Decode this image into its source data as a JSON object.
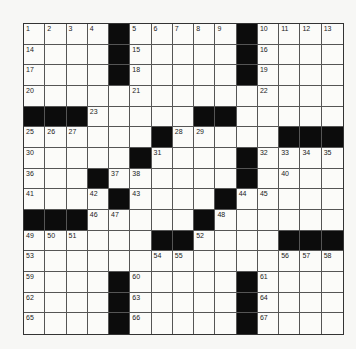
{
  "puzzle": {
    "rows": 15,
    "cols": 15,
    "colors": {
      "black": "#0c0c0c",
      "white": "#fbfbf9",
      "line": "#555555"
    },
    "layout": [
      "....#.....#....",
      "....#.....#....",
      "....#.....#....",
      "...............",
      "###.....##.....",
      "......#.....###",
      ".....#....#....",
      "...#......#....",
      "....#....#.....",
      "###.....#......",
      "......##....###",
      "...............",
      "....#.....#....",
      "....#.....#....",
      "....#.....#...."
    ],
    "numbers": [
      {
        "r": 0,
        "c": 0,
        "n": "1"
      },
      {
        "r": 0,
        "c": 1,
        "n": "2"
      },
      {
        "r": 0,
        "c": 2,
        "n": "3"
      },
      {
        "r": 0,
        "c": 3,
        "n": "4"
      },
      {
        "r": 0,
        "c": 5,
        "n": "5"
      },
      {
        "r": 0,
        "c": 6,
        "n": "6"
      },
      {
        "r": 0,
        "c": 7,
        "n": "7"
      },
      {
        "r": 0,
        "c": 8,
        "n": "8"
      },
      {
        "r": 0,
        "c": 9,
        "n": "9"
      },
      {
        "r": 0,
        "c": 11,
        "n": "10"
      },
      {
        "r": 0,
        "c": 12,
        "n": "11"
      },
      {
        "r": 0,
        "c": 13,
        "n": "12"
      },
      {
        "r": 0,
        "c": 14,
        "n": "13"
      },
      {
        "r": 1,
        "c": 0,
        "n": "14"
      },
      {
        "r": 1,
        "c": 5,
        "n": "15"
      },
      {
        "r": 1,
        "c": 11,
        "n": "16"
      },
      {
        "r": 2,
        "c": 0,
        "n": "17"
      },
      {
        "r": 2,
        "c": 5,
        "n": "18"
      },
      {
        "r": 2,
        "c": 11,
        "n": "19"
      },
      {
        "r": 3,
        "c": 0,
        "n": "20"
      },
      {
        "r": 3,
        "c": 5,
        "n": "21"
      },
      {
        "r": 3,
        "c": 11,
        "n": "22"
      },
      {
        "r": 4,
        "c": 3,
        "n": "23"
      },
      {
        "r": 4,
        "c": 9,
        "n": "24"
      },
      {
        "r": 5,
        "c": 0,
        "n": "25"
      },
      {
        "r": 5,
        "c": 1,
        "n": "26"
      },
      {
        "r": 5,
        "c": 2,
        "n": "27"
      },
      {
        "r": 5,
        "c": 7,
        "n": "28"
      },
      {
        "r": 5,
        "c": 8,
        "n": "29"
      },
      {
        "r": 6,
        "c": 0,
        "n": "30"
      },
      {
        "r": 6,
        "c": 6,
        "n": "31"
      },
      {
        "r": 6,
        "c": 11,
        "n": "32"
      },
      {
        "r": 6,
        "c": 12,
        "n": "33"
      },
      {
        "r": 6,
        "c": 13,
        "n": "34"
      },
      {
        "r": 6,
        "c": 14,
        "n": "35"
      },
      {
        "r": 7,
        "c": 0,
        "n": "36"
      },
      {
        "r": 7,
        "c": 4,
        "n": "37"
      },
      {
        "r": 7,
        "c": 5,
        "n": "38"
      },
      {
        "r": 7,
        "c": 10,
        "n": "39"
      },
      {
        "r": 7,
        "c": 12,
        "n": "40"
      },
      {
        "r": 8,
        "c": 0,
        "n": "41"
      },
      {
        "r": 8,
        "c": 3,
        "n": "42"
      },
      {
        "r": 8,
        "c": 5,
        "n": "43"
      },
      {
        "r": 8,
        "c": 10,
        "n": "44"
      },
      {
        "r": 8,
        "c": 11,
        "n": "45"
      },
      {
        "r": 9,
        "c": 3,
        "n": "46"
      },
      {
        "r": 9,
        "c": 4,
        "n": "47"
      },
      {
        "r": 9,
        "c": 9,
        "n": "48"
      },
      {
        "r": 10,
        "c": 0,
        "n": "49"
      },
      {
        "r": 10,
        "c": 1,
        "n": "50"
      },
      {
        "r": 10,
        "c": 2,
        "n": "51"
      },
      {
        "r": 10,
        "c": 8,
        "n": "52"
      },
      {
        "r": 11,
        "c": 0,
        "n": "53"
      },
      {
        "r": 11,
        "c": 6,
        "n": "54"
      },
      {
        "r": 11,
        "c": 7,
        "n": "55"
      },
      {
        "r": 11,
        "c": 12,
        "n": "56"
      },
      {
        "r": 11,
        "c": 13,
        "n": "57"
      },
      {
        "r": 11,
        "c": 14,
        "n": "58"
      },
      {
        "r": 12,
        "c": 0,
        "n": "59"
      },
      {
        "r": 12,
        "c": 5,
        "n": "60"
      },
      {
        "r": 12,
        "c": 11,
        "n": "61"
      },
      {
        "r": 13,
        "c": 0,
        "n": "62"
      },
      {
        "r": 13,
        "c": 5,
        "n": "63"
      },
      {
        "r": 13,
        "c": 11,
        "n": "64"
      },
      {
        "r": 14,
        "c": 0,
        "n": "65"
      },
      {
        "r": 14,
        "c": 5,
        "n": "66"
      },
      {
        "r": 14,
        "c": 11,
        "n": "67"
      }
    ]
  }
}
